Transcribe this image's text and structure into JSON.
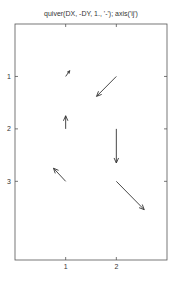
{
  "chart_data": {
    "type": "quiver",
    "title": "quiver(DX, -DY, 1., '-');  axis('ij')",
    "xlabel": "",
    "ylabel": "",
    "xlim": [
      0,
      3
    ],
    "ylim": [
      0,
      4.5
    ],
    "y_direction": "ij (reversed, increasing downward)",
    "grid": false,
    "x_ticks": [
      1,
      2
    ],
    "y_ticks": [
      1,
      2,
      3
    ],
    "x_tick_labels": [
      "1",
      "2"
    ],
    "y_tick_labels": [
      "1",
      "2",
      "3"
    ],
    "arrows": [
      {
        "x": 1,
        "y": 1,
        "u": 0.08,
        "v": -0.11
      },
      {
        "x": 1,
        "y": 2,
        "u": 0.0,
        "v": -0.25
      },
      {
        "x": 1,
        "y": 3,
        "u": -0.24,
        "v": -0.25
      },
      {
        "x": 2,
        "y": 1,
        "u": -0.39,
        "v": 0.38
      },
      {
        "x": 2,
        "y": 2,
        "u": 0.0,
        "v": 0.65
      },
      {
        "x": 2,
        "y": 3,
        "u": 0.55,
        "v": 0.54
      }
    ],
    "colors": {
      "axis": "#555555",
      "arrow": "#333333",
      "text": "#333333"
    }
  }
}
